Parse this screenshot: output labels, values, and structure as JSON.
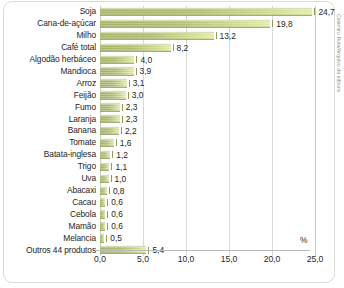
{
  "credit": "Casimiro Rola/Arquivo da editora",
  "axis": {
    "unit_label": "%",
    "tick_labels": [
      "0,0",
      "5,0",
      "10,0",
      "15,0",
      "20,0",
      "25,0"
    ]
  },
  "chart_data": {
    "type": "bar",
    "orientation": "horizontal",
    "title": "",
    "xlabel": "%",
    "ylabel": "",
    "xlim": [
      0,
      25
    ],
    "grid": true,
    "legend": false,
    "categories": [
      "Soja",
      "Cana-de-açúcar",
      "Milho",
      "Café total",
      "Algodão herbáceo",
      "Mandioca",
      "Arroz",
      "Feijão",
      "Fumo",
      "Laranja",
      "Banana",
      "Tomate",
      "Batata-inglesa",
      "Trigo",
      "Uva",
      "Abacaxi",
      "Cacau",
      "Cebola",
      "Mamão",
      "Melancia",
      "Outros 44 produtos"
    ],
    "values": [
      24.7,
      19.8,
      13.2,
      8.2,
      4.0,
      3.9,
      3.1,
      3.0,
      2.3,
      2.3,
      2.2,
      1.6,
      1.2,
      1.1,
      1.0,
      0.8,
      0.6,
      0.6,
      0.6,
      0.5,
      5.4
    ],
    "value_labels": [
      "24,7",
      "19,8",
      "13,2",
      "8,2",
      "4,0",
      "3,9",
      "3,1",
      "3,0",
      "2,3",
      "2,3",
      "2,2",
      "1,6",
      "1,2",
      "1,1",
      "1,0",
      "0,8",
      "0,6",
      "0,6",
      "0,6",
      "0,5",
      "5,4"
    ],
    "tick_values": [
      0,
      5,
      10,
      15,
      20,
      25
    ],
    "tick_labels": [
      "0,0",
      "5,0",
      "10,0",
      "15,0",
      "20,0",
      "25,0"
    ],
    "bar_color_start": "#9fae60",
    "bar_color_end": "#e2eaa4"
  }
}
